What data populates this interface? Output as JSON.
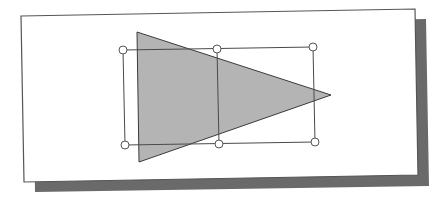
{
  "figure": {
    "colors": {
      "background": "#ffffff",
      "page": "#ffffff",
      "page_border": "#555555",
      "shadow": "#6a6a6a",
      "triangle_fill": "#b4b4b4",
      "triangle_stroke": "#3a3a3a",
      "selection_stroke": "#4a4a4a",
      "handle_fill": "#ffffff",
      "handle_stroke": "#555555"
    },
    "page": {
      "corners": [
        [
          21,
          16
        ],
        [
          415,
          9
        ],
        [
          418,
          175
        ],
        [
          24,
          182
        ]
      ]
    },
    "shadow": {
      "corners": [
        [
          33,
          26
        ],
        [
          426,
          19
        ],
        [
          429,
          186
        ],
        [
          35,
          192
        ]
      ]
    },
    "triangle": {
      "points": [
        [
          137,
          32
        ],
        [
          331,
          95
        ],
        [
          139,
          162
        ]
      ]
    },
    "selection": {
      "outer": [
        [
          123,
          50
        ],
        [
          313,
          47
        ],
        [
          315,
          142
        ],
        [
          125,
          145
        ]
      ],
      "divider": [
        [
          217,
          49
        ],
        [
          219,
          144
        ]
      ]
    },
    "handles": [
      {
        "name": "handle-top-left",
        "x": 123,
        "y": 50
      },
      {
        "name": "handle-top-middle",
        "x": 217,
        "y": 49
      },
      {
        "name": "handle-top-right",
        "x": 313,
        "y": 47
      },
      {
        "name": "handle-bottom-left",
        "x": 125,
        "y": 145
      },
      {
        "name": "handle-bottom-middle",
        "x": 219,
        "y": 144
      },
      {
        "name": "handle-bottom-right",
        "x": 315,
        "y": 142
      }
    ],
    "handle_radius": 4
  }
}
